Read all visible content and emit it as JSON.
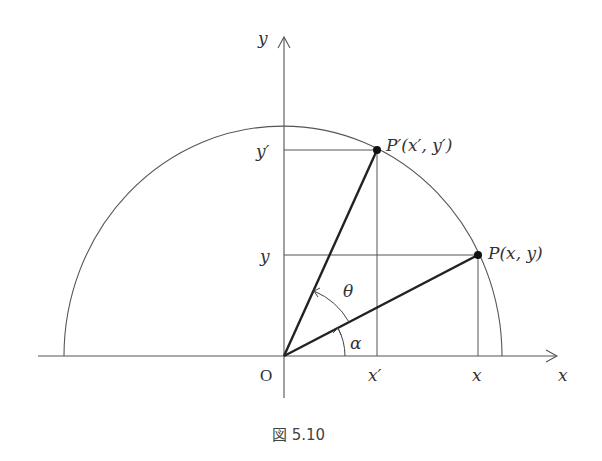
{
  "figure": {
    "caption": "図 5.10",
    "colors": {
      "thin_line": "#555555",
      "thick_line": "#222222",
      "point": "#111111",
      "text": "#333333"
    },
    "axes": {
      "x_label": "x",
      "y_label": "y",
      "origin_label": "O"
    },
    "points": {
      "P": {
        "label": "P(x, y)",
        "name": "P"
      },
      "P_prime": {
        "label": "P′(x′, y′)",
        "name": "P′"
      }
    },
    "ticks": {
      "x_tick": "x",
      "x_prime_tick": "x′",
      "y_tick": "y",
      "y_prime_tick": "y′"
    },
    "angles": {
      "alpha": "α",
      "theta": "θ"
    }
  }
}
